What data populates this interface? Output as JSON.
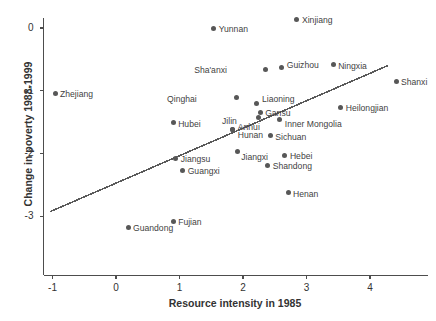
{
  "chart_data": {
    "type": "scatter",
    "title": "",
    "xlabel": "Resource intensity in 1985",
    "ylabel": "Change in poverty 1988-1999",
    "xlim": [
      -1.45,
      5.0
    ],
    "ylim": [
      -3.35,
      0.25
    ],
    "xticks": [
      -1,
      0,
      1,
      2,
      3,
      4
    ],
    "yticks": [
      0,
      -1,
      -2,
      -3
    ],
    "xtick_labels": [
      "-1",
      "0",
      "1",
      "2",
      "3",
      "4"
    ],
    "ytick_labels": [
      "0",
      "-1",
      "-2",
      "-3"
    ],
    "grid": false,
    "legend": "none",
    "point_color": "#575757",
    "line_color": "#5a5a5a",
    "axis_color": "#4d4d4d",
    "points": [
      {
        "label": "Zhejiang",
        "x": -0.96,
        "y": -1.04,
        "label_dx": 5,
        "label_dy": -3
      },
      {
        "label": "Guandong",
        "x": 0.19,
        "y": -3.18,
        "label_dx": 5,
        "label_dy": -3
      },
      {
        "label": "Fujian",
        "x": 0.9,
        "y": -3.08,
        "label_dx": 5,
        "label_dy": -3
      },
      {
        "label": "Hubei",
        "x": 0.9,
        "y": -1.51,
        "label_dx": 5,
        "label_dy": -3
      },
      {
        "label": "Jiangsu",
        "x": 0.94,
        "y": -2.08,
        "label_dx": 5,
        "label_dy": -3
      },
      {
        "label": "Guangxi",
        "x": 1.05,
        "y": -2.27,
        "label_dx": 5,
        "label_dy": -3
      },
      {
        "label": "Anhui",
        "x": 1.84,
        "y": -1.62,
        "label_dx": 5,
        "label_dy": -7
      },
      {
        "label": "Hunan",
        "x": 1.84,
        "y": -1.62,
        "label_dx": 5,
        "label_dy": 1
      },
      {
        "label": "Jiangxi",
        "x": 1.91,
        "y": -1.97,
        "label_dx": 4,
        "label_dy": 1
      },
      {
        "label": "Qinghai",
        "x": 1.9,
        "y": -1.11,
        "label_dx": -40,
        "label_dy": -3
      },
      {
        "label": "Yunnan",
        "x": 1.54,
        "y": 0.0,
        "label_dx": 5,
        "label_dy": -3
      },
      {
        "label": "Sha'anxi",
        "x": 2.36,
        "y": -0.66,
        "label_dx": -39,
        "label_dy": -3
      },
      {
        "label": "Liaoning",
        "x": 2.22,
        "y": -1.2,
        "label_dx": 5,
        "label_dy": -8
      },
      {
        "label": "Gansu",
        "x": 2.27,
        "y": -1.35,
        "label_dx": 5,
        "label_dy": -4
      },
      {
        "label": "Jilin",
        "x": 2.25,
        "y": -1.42,
        "label_dx": -22,
        "label_dy": 0
      },
      {
        "label": "Guizhou",
        "x": 2.61,
        "y": -0.63,
        "label_dx": 5,
        "label_dy": -7
      },
      {
        "label": "Sichuan",
        "x": 2.43,
        "y": -1.72,
        "label_dx": 5,
        "label_dy": -3
      },
      {
        "label": "Shandong",
        "x": 2.39,
        "y": -2.19,
        "label_dx": 5,
        "label_dy": -3
      },
      {
        "label": "Inner Mongolia",
        "x": 2.58,
        "y": -1.46,
        "label_dx": 5,
        "label_dy": 0
      },
      {
        "label": "Hebei",
        "x": 2.66,
        "y": -2.03,
        "label_dx": 5,
        "label_dy": -3
      },
      {
        "label": "Henan",
        "x": 2.71,
        "y": -2.63,
        "label_dx": 5,
        "label_dy": -3
      },
      {
        "label": "Xinjiang",
        "x": 2.85,
        "y": 0.14,
        "label_dx": 5,
        "label_dy": -3
      },
      {
        "label": "Ningxia",
        "x": 3.42,
        "y": -0.59,
        "label_dx": 5,
        "label_dy": -3
      },
      {
        "label": "Heilongjian",
        "x": 3.54,
        "y": -1.26,
        "label_dx": 5,
        "label_dy": -3
      },
      {
        "label": "Shanxi",
        "x": 4.41,
        "y": -0.85,
        "label_dx": 5,
        "label_dy": -3
      }
    ],
    "trend_line": {
      "x0": -1.04,
      "y0": -2.93,
      "x1": 4.28,
      "y1": -0.6
    }
  }
}
